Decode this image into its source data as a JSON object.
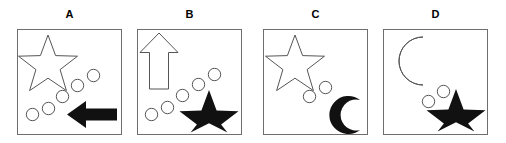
{
  "figure": {
    "type": "shape-comparison-panels",
    "background_color": "#ffffff",
    "border_color": "#6e6e6e",
    "outline_color": "#555555",
    "fill_color": "#111111",
    "panel_count": 4
  },
  "panels": [
    {
      "label": "A",
      "top_left_shape": "star-outline",
      "bottom_right_shape": "arrow-left-outline-filled",
      "dot_count": 5,
      "dots_arrangement": "diagonal-arc-lower-left-to-upper-right",
      "shapes": [
        {
          "name": "star-outline-icon",
          "style": "outline",
          "position": "top-left"
        },
        {
          "name": "dot-1-icon",
          "style": "outline",
          "position": "lower-left"
        },
        {
          "name": "dot-2-icon",
          "style": "outline",
          "position": "lower-left"
        },
        {
          "name": "dot-3-icon",
          "style": "outline",
          "position": "center"
        },
        {
          "name": "dot-4-icon",
          "style": "outline",
          "position": "upper-right"
        },
        {
          "name": "dot-5-icon",
          "style": "outline",
          "position": "upper-right"
        },
        {
          "name": "arrow-left-icon",
          "style": "filled",
          "position": "bottom-right"
        }
      ]
    },
    {
      "label": "B",
      "top_left_shape": "arrow-up-outline",
      "bottom_right_shape": "star-filled",
      "dot_count": 5,
      "dots_arrangement": "diagonal-arc-lower-left-to-upper-right",
      "shapes": [
        {
          "name": "arrow-up-icon",
          "style": "outline",
          "position": "top-left"
        },
        {
          "name": "dot-1-icon",
          "style": "outline",
          "position": "lower-left"
        },
        {
          "name": "dot-2-icon",
          "style": "outline",
          "position": "lower-left"
        },
        {
          "name": "dot-3-icon",
          "style": "outline",
          "position": "center"
        },
        {
          "name": "dot-4-icon",
          "style": "outline",
          "position": "upper-right"
        },
        {
          "name": "dot-5-icon",
          "style": "outline",
          "position": "upper-right"
        },
        {
          "name": "star-icon",
          "style": "filled",
          "position": "bottom-right"
        }
      ]
    },
    {
      "label": "C",
      "top_left_shape": "star-outline",
      "bottom_right_shape": "crescent-moon-filled",
      "dot_count": 2,
      "dots_arrangement": "diagonal-pair-center",
      "shapes": [
        {
          "name": "star-outline-icon",
          "style": "outline",
          "position": "top-left"
        },
        {
          "name": "dot-1-icon",
          "style": "outline",
          "position": "center"
        },
        {
          "name": "dot-2-icon",
          "style": "outline",
          "position": "center"
        },
        {
          "name": "crescent-moon-icon",
          "style": "filled",
          "position": "bottom-right"
        }
      ]
    },
    {
      "label": "D",
      "top_left_shape": "crescent-moon-outline",
      "bottom_right_shape": "star-filled",
      "dot_count": 2,
      "dots_arrangement": "diagonal-pair-center",
      "shapes": [
        {
          "name": "crescent-moon-outline-icon",
          "style": "outline",
          "position": "top-left"
        },
        {
          "name": "dot-1-icon",
          "style": "outline",
          "position": "center"
        },
        {
          "name": "dot-2-icon",
          "style": "outline",
          "position": "center"
        },
        {
          "name": "star-icon",
          "style": "filled",
          "position": "bottom-right"
        }
      ]
    }
  ]
}
